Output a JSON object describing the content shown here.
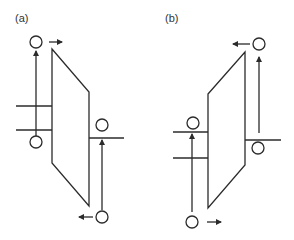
{
  "panels": [
    {
      "label": "(a)",
      "description": "Trapezoid with top edge sloping down to the right; balls and arrows showing counterclockwise circulation"
    },
    {
      "label": "(b)",
      "description": "Trapezoid with top edge sloping up to the right; balls and arrows showing clockwise circulation"
    }
  ],
  "colors": {
    "stroke": "#2b2b2b",
    "background": "#ffffff"
  }
}
